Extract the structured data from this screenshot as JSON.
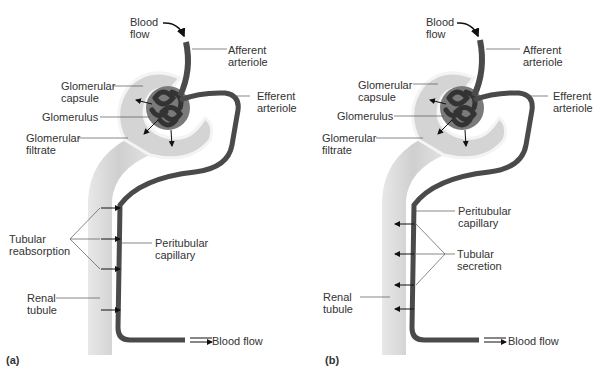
{
  "panels": [
    {
      "id": "a",
      "tag": "(a)",
      "labels": {
        "blood_flow_in": "Blood\nflow",
        "afferent": "Afferent\narteriole",
        "capsule": "Glomerular\ncapsule",
        "efferent": "Efferent\narteriole",
        "glomerulus": "Glomerulus",
        "filtrate": "Glomerular\nfiltrate",
        "process": "Tubular\nreabsorption",
        "peritubular": "Peritubular\ncapillary",
        "renal": "Renal\ntubule",
        "blood_flow_out": "Blood flow"
      }
    },
    {
      "id": "b",
      "tag": "(b)",
      "labels": {
        "blood_flow_in": "Blood\nflow",
        "afferent": "Afferent\narteriole",
        "capsule": "Glomerular\ncapsule",
        "efferent": "Efferent\narteriole",
        "glomerulus": "Glomerulus",
        "filtrate": "Glomerular\nfiltrate",
        "peritubular": "Peritubular\ncapillary",
        "process": "Tubular\nsecretion",
        "renal": "Renal\ntubule",
        "blood_flow_out": "Blood flow"
      }
    }
  ],
  "colors": {
    "tubule": "#d6d6d6",
    "capsule_edge": "#f2f2f2",
    "vessel": "#4a4a4a",
    "glomerulus_core": "#7a7a7a",
    "text": "#333333"
  }
}
